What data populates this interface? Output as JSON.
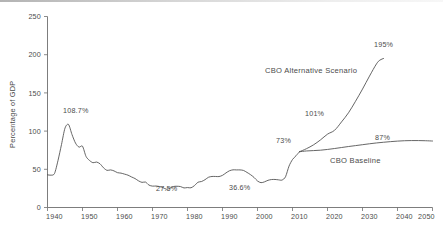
{
  "chart_data": {
    "type": "line",
    "title": "",
    "xlabel": "",
    "ylabel": "Percentage of GDP",
    "xlim": [
      1940,
      2050
    ],
    "ylim": [
      0,
      250
    ],
    "grid": false,
    "legend_position": "inline-annotations",
    "xticks": [
      "1940",
      "1950",
      "1960",
      "1970",
      "1980",
      "1990",
      "2000",
      "2010",
      "2020",
      "2030",
      "2040",
      "2050"
    ],
    "yticks": [
      "0",
      "50",
      "100",
      "150",
      "200",
      "250"
    ],
    "series": [
      {
        "name": "Historical",
        "label": "",
        "x": [
          1940,
          1941,
          1942,
          1943,
          1944,
          1945,
          1946,
          1947,
          1948,
          1949,
          1950,
          1951,
          1952,
          1953,
          1954,
          1955,
          1956,
          1957,
          1958,
          1959,
          1960,
          1961,
          1962,
          1963,
          1964,
          1965,
          1966,
          1967,
          1968,
          1969,
          1970,
          1971,
          1972,
          1973,
          1974,
          1975,
          1976,
          1977,
          1978,
          1979,
          1980,
          1981,
          1982,
          1983,
          1984,
          1985,
          1986,
          1987,
          1988,
          1989,
          1990,
          1991,
          1992,
          1993,
          1994,
          1995,
          1996,
          1997,
          1998,
          1999,
          2000,
          2001,
          2002,
          2003,
          2004,
          2005,
          2006,
          2007,
          2008,
          2009,
          2010,
          2011,
          2012
        ],
        "values": [
          42.8,
          42.3,
          44.5,
          61.5,
          82.5,
          103.9,
          108.7,
          95.5,
          84.3,
          79.0,
          80.2,
          66.9,
          61.6,
          58.6,
          59.5,
          57.2,
          52.0,
          48.6,
          49.2,
          47.9,
          45.6,
          45.0,
          43.7,
          42.3,
          40.0,
          37.9,
          34.9,
          32.9,
          33.3,
          29.3,
          28.0,
          28.1,
          27.4,
          26.0,
          23.9,
          25.3,
          27.5,
          27.8,
          27.4,
          25.6,
          26.1,
          25.8,
          28.7,
          33.1,
          34.0,
          36.4,
          39.6,
          40.6,
          40.6,
          40.5,
          42.1,
          45.3,
          48.1,
          49.3,
          49.2,
          49.2,
          48.5,
          45.9,
          43.0,
          39.4,
          34.7,
          32.5,
          33.6,
          35.6,
          36.6,
          36.7,
          36.2,
          35.9,
          40.2,
          54.1,
          62.8,
          67.7,
          73.0
        ]
      },
      {
        "name": "CBO Baseline",
        "label": "CBO Baseline",
        "x": [
          2012,
          2014,
          2016,
          2018,
          2020,
          2022,
          2024,
          2026,
          2028,
          2030,
          2032,
          2034,
          2036,
          2038,
          2040,
          2042,
          2044,
          2046,
          2048,
          2050
        ],
        "values": [
          73.0,
          74.0,
          74.5,
          75.0,
          76.0,
          77.2,
          78.5,
          79.8,
          81.0,
          82.2,
          83.4,
          84.5,
          85.4,
          86.2,
          86.9,
          87.4,
          87.6,
          87.6,
          87.4,
          87.0
        ]
      },
      {
        "name": "CBO Alternative Scenario",
        "label": "CBO Alternative Scenario",
        "x": [
          2012,
          2014,
          2016,
          2018,
          2020,
          2022,
          2024,
          2026,
          2028,
          2030,
          2032,
          2034,
          2035,
          2036
        ],
        "values": [
          73.0,
          77.0,
          82.0,
          88.5,
          96.0,
          101.0,
          112.0,
          124.0,
          139.0,
          155.0,
          172.0,
          188.0,
          193.0,
          195.0
        ]
      }
    ],
    "annotations": [
      {
        "text": "108.7%",
        "x_value": 1947,
        "y_value": 108.7,
        "note": "WWII peak of federal debt"
      },
      {
        "text": "27.5%",
        "x_value": 1976,
        "y_value": 27.5,
        "note": "Post-war low"
      },
      {
        "text": "36.6%",
        "x_value": 2004,
        "y_value": 36.6,
        "note": "Pre-crisis level"
      },
      {
        "text": "73%",
        "x_value": 2012,
        "y_value": 73.0,
        "note": "Current level"
      },
      {
        "text": "101%",
        "x_value": 2022,
        "y_value": 101.0,
        "note": "Alternative scenario"
      },
      {
        "text": "195%",
        "x_value": 2036,
        "y_value": 195.0,
        "note": "Alternative scenario endpoint"
      },
      {
        "text": "87%",
        "x_value": 2040,
        "y_value": 87.0,
        "note": "Baseline endpoint"
      }
    ],
    "series_labels": [
      {
        "text": "CBO Alternative Scenario"
      },
      {
        "text": "CBO Baseline"
      }
    ],
    "colors": {
      "line": "#4a4a4a",
      "axis": "#6e6e6e",
      "text": "#4b4b4b",
      "background": "#ffffff"
    }
  }
}
